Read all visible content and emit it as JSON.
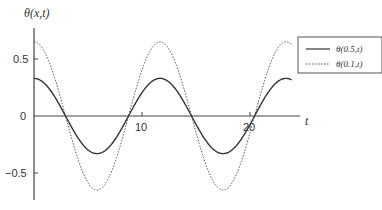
{
  "chart_data": {
    "type": "line",
    "title": "",
    "ylabel": "θ(x,t)",
    "xlabel": "t",
    "xlim": [
      0,
      24.5
    ],
    "ylim": [
      -0.75,
      0.75
    ],
    "x_ticks": [
      10,
      20
    ],
    "y_ticks": [
      0.5,
      0,
      -0.5
    ],
    "x_tick_labels": [
      "10",
      "20"
    ],
    "y_tick_labels": [
      "0.5",
      "0",
      "−0.5"
    ],
    "grid": false,
    "legend_position": "upper right",
    "series": [
      {
        "name": "θ(0.5,t)",
        "style": "solid",
        "amplitude": 0.33,
        "period": 11.67,
        "t_start": 0,
        "t_end": 23.9,
        "points": [
          [
            0,
            0.33
          ],
          [
            2.9,
            0
          ],
          [
            5.8,
            -0.33
          ],
          [
            8.75,
            0
          ],
          [
            11.67,
            0.33
          ],
          [
            14.6,
            0
          ],
          [
            17.5,
            -0.33
          ],
          [
            20.4,
            0
          ],
          [
            23.3,
            0.33
          ]
        ]
      },
      {
        "name": "θ(0.1,t)",
        "style": "dotted",
        "amplitude": 0.65,
        "period": 11.67,
        "t_start": 0,
        "t_end": 23.9,
        "points": [
          [
            0,
            0.65
          ],
          [
            2.9,
            0
          ],
          [
            5.8,
            -0.65
          ],
          [
            8.75,
            0
          ],
          [
            11.67,
            0.65
          ],
          [
            14.6,
            0
          ],
          [
            17.5,
            -0.65
          ],
          [
            20.4,
            0
          ],
          [
            23.3,
            0.65
          ]
        ]
      }
    ]
  },
  "legend": {
    "items": [
      {
        "label": "θ(0.5,t)",
        "style": "solid"
      },
      {
        "label": "θ(0.1,t)",
        "style": "dotted"
      }
    ]
  },
  "colors": {
    "line": "#333333",
    "axis": "#444444"
  }
}
